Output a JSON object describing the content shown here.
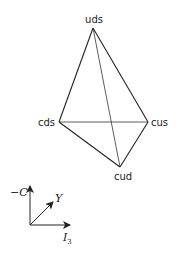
{
  "diagram": {
    "type": "weight-diagram-tetrahedron",
    "vertices": [
      {
        "id": "uds",
        "label": "uds"
      },
      {
        "id": "cds",
        "label": "cds"
      },
      {
        "id": "cus",
        "label": "cus"
      },
      {
        "id": "cud",
        "label": "cud"
      }
    ],
    "edges": [
      [
        "uds",
        "cds"
      ],
      [
        "uds",
        "cus"
      ],
      [
        "uds",
        "cud"
      ],
      [
        "cds",
        "cus"
      ],
      [
        "cds",
        "cud"
      ],
      [
        "cus",
        "cud"
      ]
    ],
    "axes": {
      "vertical": {
        "label": "−C"
      },
      "diagonal": {
        "label": "Y"
      },
      "horizontal": {
        "label": "I",
        "subscript": "3"
      }
    }
  }
}
